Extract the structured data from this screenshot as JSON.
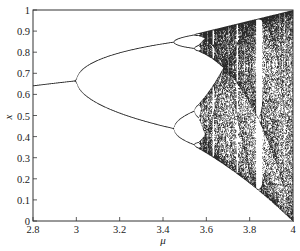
{
  "chart_data": {
    "type": "scatter",
    "title": "",
    "subtitle": "Bifurcation diagram of the logistic map x_{n+1} = mu x_n (1 - x_n)",
    "xlabel": "μ",
    "ylabel": "x",
    "xlim": [
      2.8,
      4.0
    ],
    "ylim": [
      0,
      1
    ],
    "grid": false,
    "legend": null,
    "x_ticks": [
      2.8,
      3,
      3.2,
      3.4,
      3.6,
      3.8,
      4
    ],
    "x_tick_labels": [
      "2.8",
      "3",
      "3.2",
      "3.4",
      "3.6",
      "3.8",
      "4"
    ],
    "y_ticks": [
      0,
      0.1,
      0.2,
      0.3,
      0.4,
      0.5,
      0.6,
      0.7,
      0.8,
      0.9,
      1
    ],
    "y_tick_labels": [
      "0",
      "0.1",
      "0.2",
      "0.3",
      "0.4",
      "0.5",
      "0.6",
      "0.7",
      "0.8",
      "0.9",
      "1"
    ],
    "series": [
      {
        "name": "attractor",
        "map": "logistic",
        "mu_start": 2.8,
        "mu_end": 4.0,
        "transient_iterations": 400,
        "plotted_iterations": 160,
        "key_points": [
          {
            "mu": 2.8,
            "x": [
              0.643
            ]
          },
          {
            "mu": 3.0,
            "x": [
              0.667
            ]
          },
          {
            "mu": 3.2,
            "x": [
              0.513,
              0.799
            ]
          },
          {
            "mu": 3.449,
            "x": [
              0.44,
              0.852
            ]
          },
          {
            "mu": 3.5,
            "x": [
              0.383,
              0.501,
              0.827,
              0.875
            ]
          },
          {
            "mu": 3.57,
            "x": [
              0.35,
              0.89
            ],
            "note": "onset of chaos"
          },
          {
            "mu": 3.68,
            "x": [
              0.26,
              0.92
            ]
          },
          {
            "mu": 4.0,
            "x": [
              0.0,
              1.0
            ]
          }
        ]
      }
    ],
    "colors": {
      "points": "#2a2a2a",
      "axes": "#333333",
      "background": "#ffffff"
    }
  }
}
